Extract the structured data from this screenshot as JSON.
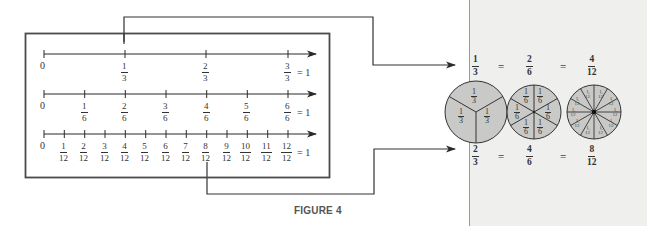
{
  "figure": {
    "caption": "FIGURE 4",
    "number_lines": [
      {
        "name": "thirds",
        "zero_label": "0",
        "ticks": [
          {
            "num": "1",
            "den": "3"
          },
          {
            "num": "2",
            "den": "3"
          },
          {
            "num": "3",
            "den": "3"
          }
        ],
        "end_equals": "= 1"
      },
      {
        "name": "sixths",
        "zero_label": "0",
        "ticks": [
          {
            "num": "1",
            "den": "6"
          },
          {
            "num": "2",
            "den": "6"
          },
          {
            "num": "3",
            "den": "6"
          },
          {
            "num": "4",
            "den": "6"
          },
          {
            "num": "5",
            "den": "6"
          },
          {
            "num": "6",
            "den": "6"
          }
        ],
        "end_equals": "= 1"
      },
      {
        "name": "twelfths",
        "zero_label": "0",
        "ticks": [
          {
            "num": "1",
            "den": "12"
          },
          {
            "num": "2",
            "den": "12"
          },
          {
            "num": "3",
            "den": "12"
          },
          {
            "num": "4",
            "den": "12"
          },
          {
            "num": "5",
            "den": "12"
          },
          {
            "num": "6",
            "den": "12"
          },
          {
            "num": "7",
            "den": "12"
          },
          {
            "num": "8",
            "den": "12"
          },
          {
            "num": "9",
            "den": "12"
          },
          {
            "num": "10",
            "den": "12"
          },
          {
            "num": "11",
            "den": "12"
          },
          {
            "num": "12",
            "den": "12"
          }
        ],
        "end_equals": "= 1"
      }
    ],
    "equivalence_top": {
      "fractions": [
        {
          "num": "1",
          "den": "3"
        },
        {
          "num": "2",
          "den": "6"
        },
        {
          "num": "4",
          "den": "12"
        }
      ],
      "equals": "="
    },
    "equivalence_bottom": {
      "fractions": [
        {
          "num": "2",
          "den": "3"
        },
        {
          "num": "4",
          "den": "6"
        },
        {
          "num": "8",
          "den": "12"
        }
      ],
      "equals": "="
    },
    "pies": [
      {
        "name": "thirds-circle",
        "segments": 3,
        "label": {
          "num": "1",
          "den": "3"
        }
      },
      {
        "name": "sixths-circle",
        "segments": 6,
        "label": {
          "num": "1",
          "den": "6"
        }
      },
      {
        "name": "twelfths-circle",
        "segments": 12,
        "label": {
          "num": "1",
          "den": "12"
        }
      }
    ],
    "colors": {
      "line": "#2a2a2a",
      "frame": "#4a4a4a",
      "pie_fill": "#c9c9c7",
      "panel_bg": "#efefed"
    }
  }
}
